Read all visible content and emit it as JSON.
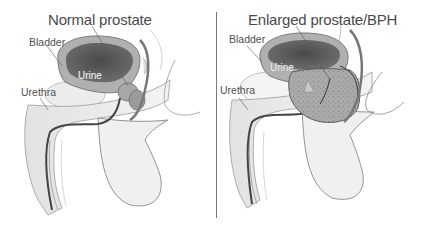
{
  "figure": {
    "type": "anatomical-comparison",
    "panels": [
      {
        "title": "Normal prostate",
        "labels": {
          "bladder": "Bladder",
          "urine": "Urine",
          "urethra": "Urethra"
        }
      },
      {
        "title": "Enlarged prostate/BPH",
        "labels": {
          "bladder": "Bladder",
          "urine": "Urine",
          "urethra": "Urethra"
        }
      }
    ],
    "colors": {
      "background": "#ffffff",
      "bladder_interior": "#555555",
      "tissue": "#bdbdbd",
      "outline": "#6a6a6a",
      "text": "#4a4a4a",
      "divider": "#7a7a7a"
    }
  }
}
